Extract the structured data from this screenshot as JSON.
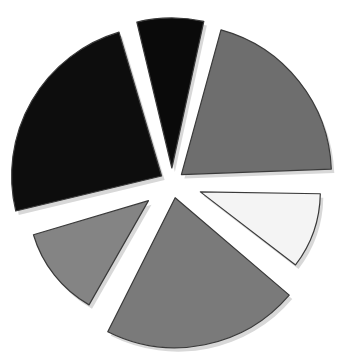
{
  "chart_data": {
    "type": "pie",
    "title": "",
    "exploded": true,
    "categories": [
      "Slice A",
      "Slice B",
      "Slice C",
      "Slice D",
      "Slice E",
      "Slice F"
    ],
    "values": [
      8,
      21,
      11,
      22,
      13,
      25
    ],
    "colors": [
      "#0a0a0a",
      "#6e6e6e",
      "#f4f4f4",
      "#7a7a7a",
      "#848484",
      "#0d0d0d"
    ],
    "start_angle_deg": -15,
    "legend": "none"
  },
  "style": {
    "outline": "#3a3a3a",
    "shadow": "#d8d8d8",
    "background": "#ffffff"
  }
}
